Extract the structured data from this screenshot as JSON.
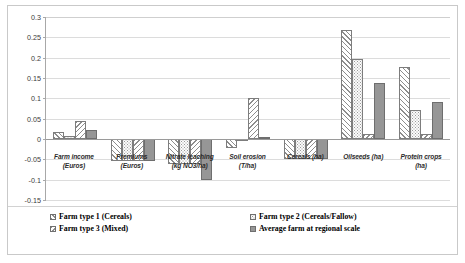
{
  "chart_data": {
    "type": "bar",
    "title": "",
    "xlabel": "",
    "ylabel": "",
    "ylim": [
      -0.15,
      0.3
    ],
    "ytick_values": [
      0.3,
      0.25,
      0.2,
      0.15,
      0.1,
      0.05,
      0,
      -0.05,
      -0.1,
      -0.15
    ],
    "ytick_labels": [
      "0.3",
      "0.25",
      "0.2",
      "0.15",
      "0.1",
      "0.05",
      "0",
      "-0.05",
      "-0.1",
      "-0.15"
    ],
    "grid": true,
    "legend_position": "bottom",
    "categories": [
      "Farm income (Euros)",
      "Premiums (Euros)",
      "Nitrate leaching (kg NO3/ha)",
      "Soil erosion (T/ha)",
      "Cereals (ha)",
      "Oilseeds (ha)",
      "Protein crops (ha)"
    ],
    "category_lines": [
      [
        "Farm income",
        "(Euros)"
      ],
      [
        "Premiums",
        "(Euros)"
      ],
      [
        "Nitrate leaching",
        "(kg NO3/ha)"
      ],
      [
        "Soil erosion",
        "(T/ha)"
      ],
      [
        "Cereals (ha)",
        ""
      ],
      [
        "Oilseeds (ha)",
        ""
      ],
      [
        "Protein crops",
        "(ha)"
      ]
    ],
    "series": [
      {
        "name": "Farm type 1 (Cereals)",
        "pattern": "diagonal-hatch-up",
        "color": "#ffffff",
        "values": [
          0.018,
          -0.055,
          -0.062,
          -0.022,
          -0.05,
          0.268,
          0.178
        ]
      },
      {
        "name": "Farm type 2 (Cereals/Fallow)",
        "pattern": "dotted",
        "color": "#fbfbfb",
        "values": [
          0.008,
          -0.055,
          -0.062,
          0.0,
          -0.05,
          0.196,
          0.072
        ]
      },
      {
        "name": "Farm type 3 (Mixed)",
        "pattern": "diagonal-hatch-down",
        "color": "#ffffff",
        "values": [
          0.045,
          -0.055,
          -0.062,
          0.1,
          -0.05,
          0.013,
          0.012
        ]
      },
      {
        "name": "Average farm at regional scale",
        "pattern": "solid-gray",
        "color": "#969696",
        "values": [
          0.023,
          -0.055,
          -0.1,
          0.005,
          -0.05,
          0.138,
          0.092
        ]
      }
    ]
  },
  "legend": {
    "items": [
      {
        "label": "Farm type 1 (Cereals)"
      },
      {
        "label": "Farm type 2 (Cereals/Fallow)"
      },
      {
        "label": "Farm type 3 (Mixed)"
      },
      {
        "label": "Average farm at regional scale"
      }
    ]
  }
}
